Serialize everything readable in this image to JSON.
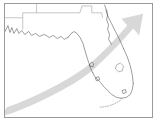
{
  "map": {
    "title": "Florida storm track map",
    "region_label": "Florida",
    "frame_color": "#9a9a9a",
    "background_color": "#ffffff",
    "coastline_color": "#4a4a4a",
    "state_border_color": "#8a8a8a",
    "arrow_color": "#c9c9c9",
    "features": [
      {
        "name": "gulf-coast",
        "label": "Gulf of Mexico coastline"
      },
      {
        "name": "atlantic-coast",
        "label": "Atlantic coastline"
      },
      {
        "name": "panhandle",
        "label": "Florida Panhandle"
      },
      {
        "name": "peninsula",
        "label": "Florida Peninsula"
      },
      {
        "name": "lake-okeechobee",
        "label": "Lake Okeechobee"
      },
      {
        "name": "florida-keys",
        "label": "Florida Keys"
      },
      {
        "name": "state-borders",
        "label": "Alabama and Georgia state borders"
      }
    ],
    "overlay": {
      "type": "arrow",
      "label": "Storm motion track",
      "direction": "southwest to northeast",
      "start": "lower-left",
      "end": "upper-right",
      "arrowhead": "upper-right"
    }
  }
}
